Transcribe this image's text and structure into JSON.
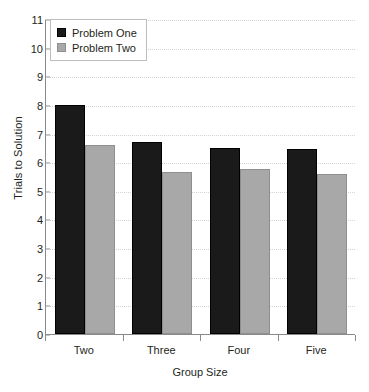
{
  "chart_data": {
    "type": "bar",
    "title": "",
    "xlabel": "Group Size",
    "ylabel": "Trials to Solution",
    "categories": [
      "Two",
      "Three",
      "Four",
      "Five"
    ],
    "series": [
      {
        "name": "Problem One",
        "color": "#1a1a1a",
        "values": [
          8.0,
          6.7,
          6.5,
          6.45
        ]
      },
      {
        "name": "Problem Two",
        "color": "#a8a8a8",
        "values": [
          6.6,
          5.65,
          5.75,
          5.6
        ]
      }
    ],
    "ylim": [
      0,
      11
    ],
    "yticks": [
      0,
      1,
      2,
      3,
      4,
      5,
      6,
      7,
      8,
      9,
      10,
      11
    ],
    "ytick_labels": [
      "0",
      "1",
      "2",
      "3",
      "4",
      "5",
      "6",
      "7",
      "8",
      "9",
      "10",
      "11"
    ],
    "grid": true,
    "legend_position": "top-left"
  }
}
